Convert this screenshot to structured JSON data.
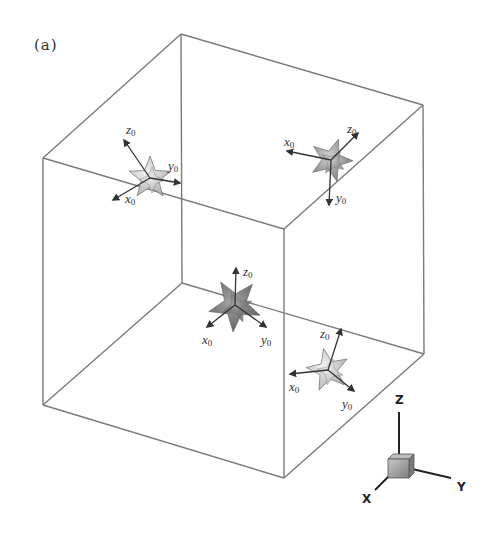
{
  "panel": {
    "label": "(a)"
  },
  "colors": {
    "cube_edge": "#7a7a7a",
    "axis": "#333333",
    "crystal_light": "#d9d9d9",
    "crystal_mid": "#a6a6a6",
    "crystal_dark": "#6e6e6e",
    "triad_box": "#9a9a9a"
  },
  "cube": {
    "vertices": {
      "top_back": [
        181,
        34
      ],
      "top_right": [
        423,
        105
      ],
      "top_front": [
        284,
        229
      ],
      "top_left": [
        43,
        158
      ],
      "bottom_back": [
        182,
        283
      ],
      "bottom_right": [
        424,
        354
      ],
      "bottom_front": [
        284,
        478
      ],
      "bottom_left": [
        43,
        405
      ]
    }
  },
  "crystals": [
    {
      "id": "crystal-top-left",
      "center": [
        150,
        178
      ],
      "shade": "light",
      "axes": [
        {
          "name": "z",
          "sub": "0",
          "end": [
            124,
            140
          ],
          "label_pos": [
            126,
            134
          ]
        },
        {
          "name": "y",
          "sub": "0",
          "end": [
            180,
            183
          ],
          "label_pos": [
            168,
            170
          ]
        },
        {
          "name": "x",
          "sub": "0",
          "end": [
            113,
            200
          ],
          "label_pos": [
            125,
            203
          ]
        }
      ]
    },
    {
      "id": "crystal-top-right",
      "center": [
        331,
        160
      ],
      "shade": "mid",
      "axes": [
        {
          "name": "x",
          "sub": "0",
          "end": [
            287,
            151
          ],
          "label_pos": [
            284,
            146
          ]
        },
        {
          "name": "z",
          "sub": "0",
          "end": [
            358,
            133
          ],
          "label_pos": [
            347,
            133
          ]
        },
        {
          "name": "y",
          "sub": "0",
          "end": [
            329,
            205
          ],
          "label_pos": [
            336,
            202
          ]
        }
      ]
    },
    {
      "id": "crystal-bottom-center",
      "center": [
        235,
        305
      ],
      "shade": "dark",
      "axes": [
        {
          "name": "z",
          "sub": "0",
          "end": [
            236,
            268
          ],
          "label_pos": [
            243,
            276
          ]
        },
        {
          "name": "x",
          "sub": "0",
          "end": [
            207,
            327
          ],
          "label_pos": [
            202,
            344
          ]
        },
        {
          "name": "y",
          "sub": "0",
          "end": [
            266,
            327
          ],
          "label_pos": [
            261,
            344
          ]
        }
      ]
    },
    {
      "id": "crystal-bottom-right",
      "center": [
        328,
        370
      ],
      "shade": "light",
      "axes": [
        {
          "name": "z",
          "sub": "0",
          "end": [
            341,
            329
          ],
          "label_pos": [
            320,
            338
          ]
        },
        {
          "name": "x",
          "sub": "0",
          "end": [
            290,
            374
          ],
          "label_pos": [
            289,
            391
          ]
        },
        {
          "name": "y",
          "sub": "0",
          "end": [
            354,
            391
          ],
          "label_pos": [
            342,
            408
          ]
        }
      ]
    }
  ],
  "triad": {
    "box_center": [
      399,
      466
    ],
    "axes": [
      {
        "label": "Z",
        "end": [
          399,
          412
        ],
        "label_pos": [
          395,
          404
        ]
      },
      {
        "label": "Y",
        "end": [
          451,
          478
        ],
        "label_pos": [
          457,
          491
        ]
      },
      {
        "label": "X",
        "end": [
          375,
          490
        ],
        "label_pos": [
          362,
          503
        ]
      }
    ]
  }
}
